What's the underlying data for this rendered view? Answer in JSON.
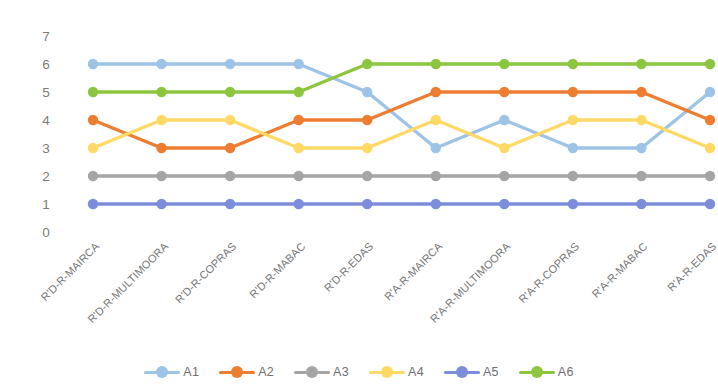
{
  "chart_data": {
    "type": "line",
    "title": "",
    "xlabel": "",
    "ylabel": "",
    "ylim": [
      0,
      7
    ],
    "ytick_labels": [
      "7",
      "6",
      "5",
      "4",
      "3",
      "2",
      "1",
      "0"
    ],
    "ytick_values": [
      7,
      6,
      5,
      4,
      3,
      2,
      1,
      0
    ],
    "grid": false,
    "legend_position": "bottom",
    "categories": [
      "R'D-R-MAIRCA",
      "R'D-R-MULTIMOORA",
      "R'D-R-COPRAS",
      "R'D-R-MABAC",
      "R'D-R-EDAS",
      "R'A-R-MAIRCA",
      "R'A-R-MULTIMOORA",
      "R'A-R-COPRAS",
      "R'A-R-MABAC",
      "R'A-R-EDAS"
    ],
    "series": [
      {
        "name": "A1",
        "color": "#9DC3E6",
        "values": [
          6,
          6,
          6,
          6,
          5,
          3,
          4,
          3,
          3,
          5
        ]
      },
      {
        "name": "A2",
        "color": "#ED7D31",
        "values": [
          4,
          3,
          3,
          4,
          4,
          5,
          5,
          5,
          5,
          4
        ]
      },
      {
        "name": "A3",
        "color": "#A5A5A5",
        "values": [
          2,
          2,
          2,
          2,
          2,
          2,
          2,
          2,
          2,
          2
        ]
      },
      {
        "name": "A4",
        "color": "#FFD966",
        "values": [
          3,
          4,
          4,
          3,
          3,
          4,
          3,
          4,
          4,
          3
        ]
      },
      {
        "name": "A5",
        "color": "#7B8DDB",
        "values": [
          1,
          1,
          1,
          1,
          1,
          1,
          1,
          1,
          1,
          1
        ]
      },
      {
        "name": "A6",
        "color": "#8CC63E",
        "values": [
          5,
          5,
          5,
          5,
          6,
          6,
          6,
          6,
          6,
          6
        ]
      }
    ]
  }
}
